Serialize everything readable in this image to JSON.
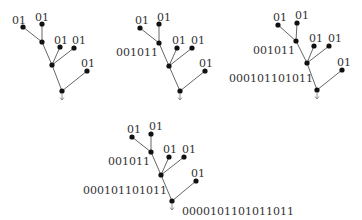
{
  "diagram": {
    "title": "",
    "colors": {
      "edge": "#555555",
      "node": "#111111",
      "text": "#333333",
      "background": "#ffffff"
    },
    "trees": [
      {
        "id": "tree-1",
        "nodes": [
          {
            "id": "a",
            "x": 23,
            "y": 27,
            "label": "01",
            "lx": 12,
            "ly": 16
          },
          {
            "id": "b",
            "x": 42,
            "y": 24,
            "label": "01",
            "lx": 35,
            "ly": 13
          },
          {
            "id": "c",
            "x": 42,
            "y": 42,
            "label": "",
            "lx": 0,
            "ly": 0
          },
          {
            "id": "d",
            "x": 60,
            "y": 47,
            "label": "01",
            "lx": 54,
            "ly": 36
          },
          {
            "id": "e",
            "x": 74,
            "y": 48,
            "label": "01",
            "lx": 72,
            "ly": 36
          },
          {
            "id": "f",
            "x": 52,
            "y": 65,
            "label": "",
            "lx": 0,
            "ly": 0
          },
          {
            "id": "g",
            "x": 87,
            "y": 71,
            "label": "01",
            "lx": 81,
            "ly": 59
          },
          {
            "id": "h",
            "x": 62,
            "y": 91,
            "label": "",
            "lx": 0,
            "ly": 0
          }
        ],
        "edges": [
          [
            "a",
            "c"
          ],
          [
            "b",
            "c"
          ],
          [
            "c",
            "f"
          ],
          [
            "d",
            "f"
          ],
          [
            "e",
            "f"
          ],
          [
            "f",
            "h"
          ],
          [
            "g",
            "h"
          ]
        ],
        "root": "h"
      },
      {
        "id": "tree-2",
        "nodes": [
          {
            "id": "a",
            "x": 140,
            "y": 28,
            "label": "01",
            "lx": 135,
            "ly": 16
          },
          {
            "id": "b",
            "x": 159,
            "y": 24,
            "label": "01",
            "lx": 157,
            "ly": 13
          },
          {
            "id": "c",
            "x": 159,
            "y": 43,
            "label": "001011",
            "lx": 116,
            "ly": 48
          },
          {
            "id": "d",
            "x": 177,
            "y": 48,
            "label": "01",
            "lx": 172,
            "ly": 36
          },
          {
            "id": "e",
            "x": 192,
            "y": 48,
            "label": "01",
            "lx": 191,
            "ly": 36
          },
          {
            "id": "f",
            "x": 169,
            "y": 66,
            "label": "",
            "lx": 0,
            "ly": 0
          },
          {
            "id": "g",
            "x": 205,
            "y": 71,
            "label": "01",
            "lx": 199,
            "ly": 59
          },
          {
            "id": "h",
            "x": 180,
            "y": 91,
            "label": "",
            "lx": 0,
            "ly": 0
          }
        ],
        "edges": [
          [
            "a",
            "c"
          ],
          [
            "b",
            "c"
          ],
          [
            "c",
            "f"
          ],
          [
            "d",
            "f"
          ],
          [
            "e",
            "f"
          ],
          [
            "f",
            "h"
          ],
          [
            "g",
            "h"
          ]
        ],
        "root": "h"
      },
      {
        "id": "tree-3",
        "nodes": [
          {
            "id": "a",
            "x": 278,
            "y": 25,
            "label": "01",
            "lx": 273,
            "ly": 13
          },
          {
            "id": "b",
            "x": 297,
            "y": 23,
            "label": "01",
            "lx": 295,
            "ly": 11
          },
          {
            "id": "c",
            "x": 296,
            "y": 41,
            "label": "001011",
            "lx": 253,
            "ly": 46
          },
          {
            "id": "d",
            "x": 314,
            "y": 46,
            "label": "01",
            "lx": 309,
            "ly": 34
          },
          {
            "id": "e",
            "x": 329,
            "y": 46,
            "label": "01",
            "lx": 328,
            "ly": 34
          },
          {
            "id": "f",
            "x": 307,
            "y": 63,
            "label": "000101101011",
            "lx": 229,
            "ly": 74
          },
          {
            "id": "g",
            "x": 342,
            "y": 70,
            "label": "01",
            "lx": 337,
            "ly": 58
          },
          {
            "id": "h",
            "x": 317,
            "y": 90,
            "label": "",
            "lx": 0,
            "ly": 0
          }
        ],
        "edges": [
          [
            "a",
            "c"
          ],
          [
            "b",
            "c"
          ],
          [
            "c",
            "f"
          ],
          [
            "d",
            "f"
          ],
          [
            "e",
            "f"
          ],
          [
            "f",
            "h"
          ],
          [
            "g",
            "h"
          ]
        ],
        "root": "h"
      },
      {
        "id": "tree-4",
        "nodes": [
          {
            "id": "a",
            "x": 132,
            "y": 137,
            "label": "01",
            "lx": 127,
            "ly": 125
          },
          {
            "id": "b",
            "x": 151,
            "y": 134,
            "label": "01",
            "lx": 149,
            "ly": 122
          },
          {
            "id": "c",
            "x": 151,
            "y": 152,
            "label": "001011",
            "lx": 108,
            "ly": 157
          },
          {
            "id": "d",
            "x": 169,
            "y": 157,
            "label": "01",
            "lx": 163,
            "ly": 145
          },
          {
            "id": "e",
            "x": 184,
            "y": 157,
            "label": "01",
            "lx": 182,
            "ly": 145
          },
          {
            "id": "f",
            "x": 161,
            "y": 175,
            "label": "000101101011",
            "lx": 83,
            "ly": 186
          },
          {
            "id": "g",
            "x": 196,
            "y": 181,
            "label": "01",
            "lx": 191,
            "ly": 169
          },
          {
            "id": "h",
            "x": 172,
            "y": 201,
            "label": "0000101101011011",
            "lx": 182,
            "ly": 207
          }
        ],
        "edges": [
          [
            "a",
            "c"
          ],
          [
            "b",
            "c"
          ],
          [
            "c",
            "f"
          ],
          [
            "d",
            "f"
          ],
          [
            "e",
            "f"
          ],
          [
            "f",
            "h"
          ],
          [
            "g",
            "h"
          ]
        ],
        "root": "h"
      }
    ]
  }
}
